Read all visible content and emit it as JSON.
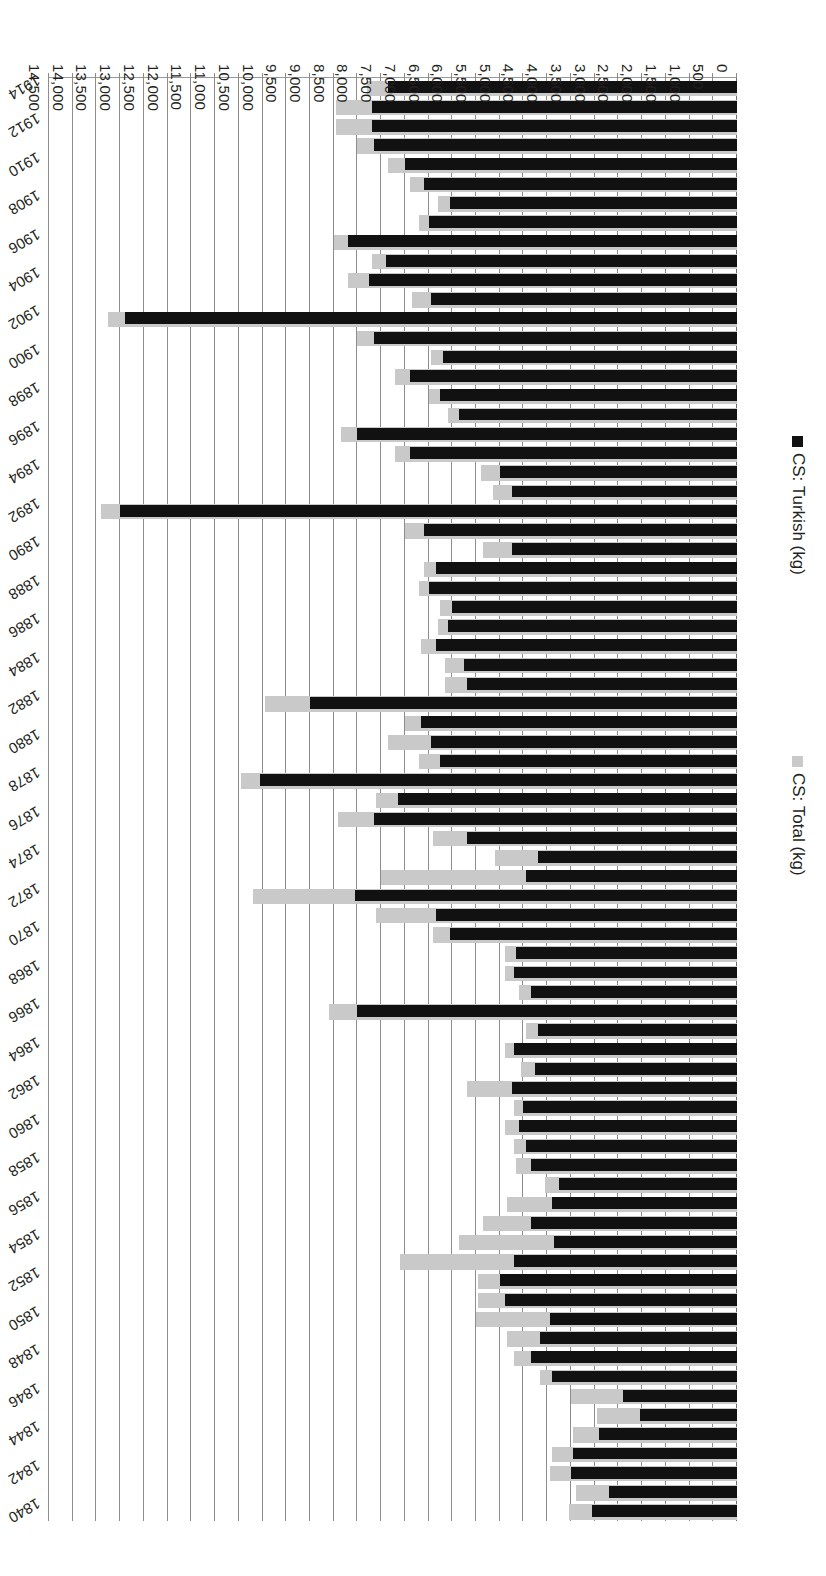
{
  "chart_data": {
    "type": "bar",
    "orientation": "horizontal",
    "title": "",
    "xlabel": "Opium imported (kg)",
    "ylabel": "",
    "grid": true,
    "legend_position": "left",
    "xlim": [
      0,
      14500
    ],
    "xtick_step": 500,
    "xticks": [
      "0",
      "500",
      "1,000",
      "1,500",
      "2,000",
      "2,500",
      "3,000",
      "3,500",
      "4,000",
      "4,500",
      "5,000",
      "5,500",
      "6,000",
      "6,500",
      "7,000",
      "7,500",
      "8,000",
      "8,500",
      "9,000",
      "9,500",
      "10,000",
      "10,500",
      "11,000",
      "11,500",
      "12,000",
      "12,500",
      "13,000",
      "13,500",
      "14,000",
      "14,500"
    ],
    "categories": [
      1840,
      1841,
      1842,
      1843,
      1844,
      1845,
      1846,
      1847,
      1848,
      1849,
      1850,
      1851,
      1852,
      1853,
      1854,
      1855,
      1856,
      1857,
      1858,
      1859,
      1860,
      1861,
      1862,
      1863,
      1864,
      1865,
      1866,
      1867,
      1868,
      1869,
      1870,
      1871,
      1872,
      1873,
      1874,
      1875,
      1876,
      1877,
      1878,
      1879,
      1880,
      1881,
      1882,
      1883,
      1884,
      1885,
      1886,
      1887,
      1888,
      1889,
      1890,
      1891,
      1892,
      1893,
      1894,
      1895,
      1896,
      1897,
      1898,
      1899,
      1900,
      1901,
      1902,
      1903,
      1904,
      1905,
      1906,
      1907,
      1908,
      1909,
      1910,
      1911,
      1912,
      1913,
      1914
    ],
    "category_label_step": 2,
    "category_labels_shown": [
      "1840",
      "1842",
      "1844",
      "1846",
      "1848",
      "1850",
      "1852",
      "1854",
      "1856",
      "1858",
      "1860",
      "1862",
      "1864",
      "1866",
      "1868",
      "1870",
      "1872",
      "1874",
      "1876",
      "1878",
      "1880",
      "1882",
      "1884",
      "1886",
      "1888",
      "1890",
      "1892",
      "1894",
      "1896",
      "1898",
      "1900",
      "1902",
      "1904",
      "1906",
      "1908",
      "1910",
      "1912",
      "1914"
    ],
    "series": [
      {
        "name": "CS: Total (kg)",
        "key": "total",
        "color": "#c9c9c9",
        "values": [
          3550,
          3400,
          3950,
          3900,
          3450,
          2950,
          3500,
          4150,
          4700,
          4850,
          5500,
          5450,
          5450,
          7100,
          5850,
          5350,
          4850,
          4050,
          4650,
          4700,
          4900,
          4700,
          5700,
          4550,
          4900,
          4450,
          8600,
          4600,
          4900,
          4900,
          6400,
          7600,
          10200,
          7500,
          5100,
          6400,
          8400,
          7600,
          10450,
          6700,
          7350,
          7000,
          9950,
          6150,
          6150,
          6650,
          6300,
          6250,
          6700,
          6600,
          5350,
          7000,
          13400,
          5150,
          5400,
          7200,
          8350,
          6100,
          6500,
          7200,
          6450,
          8000,
          13250,
          6850,
          8200,
          7700,
          8500,
          6700,
          6300,
          6900,
          7350,
          8000,
          8450,
          8450,
          7800
        ]
      },
      {
        "name": "CS: Turkish (kg)",
        "key": "turkish",
        "color": "#111111",
        "values": [
          3050,
          2700,
          3500,
          3450,
          2900,
          2050,
          2400,
          3900,
          4350,
          4150,
          3950,
          4900,
          5000,
          4700,
          3850,
          4350,
          3900,
          3750,
          4350,
          4450,
          4600,
          4500,
          4750,
          4250,
          4700,
          4200,
          8000,
          4350,
          4700,
          4650,
          6050,
          6350,
          8050,
          4450,
          4200,
          5700,
          7650,
          7150,
          10050,
          6250,
          6450,
          6650,
          9000,
          5700,
          5750,
          6350,
          6100,
          6000,
          6500,
          6350,
          4750,
          6600,
          13000,
          4750,
          5000,
          6900,
          8000,
          5850,
          6250,
          6900,
          6200,
          7650,
          12900,
          6450,
          7750,
          7400,
          8200,
          6500,
          6050,
          6600,
          7000,
          7650,
          7700,
          7700,
          7350
        ]
      }
    ]
  },
  "legend": {
    "items": [
      {
        "label": "CS: Total (kg)",
        "color": "#c9c9c9"
      },
      {
        "label": "CS: Turkish (kg)",
        "color": "#111111"
      }
    ]
  },
  "axis": {
    "title": "Opium imported (kg)"
  }
}
